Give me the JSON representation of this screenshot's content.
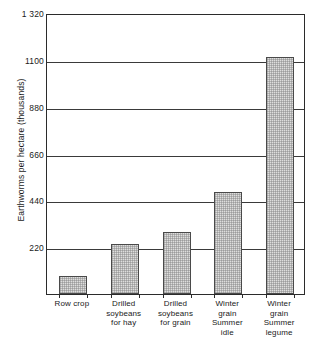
{
  "chart_data": {
    "type": "bar",
    "title": "",
    "xlabel": "",
    "ylabel": "Earthworms per hectare (thousands)",
    "categories": [
      "Row crop",
      "Drilled soybeans for hay",
      "Drilled soybeans for grain",
      "Winter grain Summer idle",
      "Winter grain Summer legume"
    ],
    "category_lines": [
      [
        "Row crop"
      ],
      [
        "Drilled",
        "soybeans",
        "for hay"
      ],
      [
        "Drilled",
        "soybeans",
        "for grain"
      ],
      [
        "Winter",
        "grain",
        "Summer",
        "idle"
      ],
      [
        "Winter",
        "grain",
        "Summer",
        "legume"
      ]
    ],
    "values": [
      85,
      237,
      290,
      478,
      1115
    ],
    "ylim": [
      0,
      1320
    ],
    "yticks": [
      220,
      440,
      660,
      880,
      1100,
      1320
    ],
    "ytick_labels": [
      "220",
      "440",
      "660",
      "880",
      "1100",
      "1 320"
    ],
    "grid": true,
    "legend": "none",
    "bar_fill_color": "#dededd",
    "bar_edge_color": "#4a4a4a",
    "axis_color": "#2b2b2b"
  }
}
